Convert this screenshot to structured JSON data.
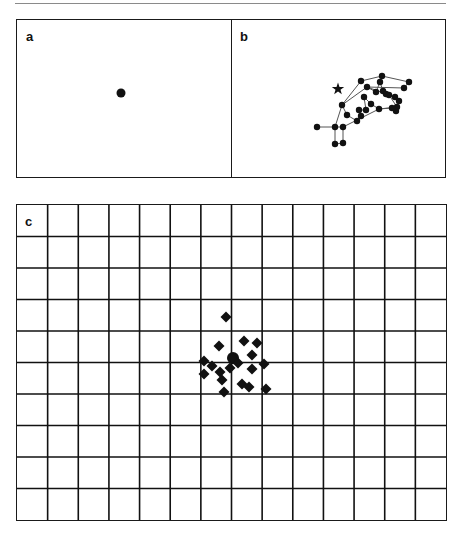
{
  "figure": {
    "panels": [
      {
        "id": "a",
        "label": "a"
      },
      {
        "id": "b",
        "label": "b"
      },
      {
        "id": "c",
        "label": "c"
      }
    ]
  },
  "chart_data": [
    {
      "panel": "a",
      "type": "scatter",
      "title": "",
      "xlabel": "",
      "ylabel": "",
      "grid": false,
      "description": "Single fixation target dot in an empty field",
      "points": [
        {
          "x": 121,
          "y": 93,
          "marker": "circle"
        }
      ]
    },
    {
      "panel": "b",
      "type": "line",
      "title": "",
      "xlabel": "",
      "ylabel": "",
      "grid": false,
      "description": "Fixation trace: connected dots clustered up-right of the target star",
      "target": {
        "x": 338,
        "y": 89,
        "marker": "star"
      },
      "points": [
        {
          "x": 317,
          "y": 127
        },
        {
          "x": 335,
          "y": 127
        },
        {
          "x": 343,
          "y": 127
        },
        {
          "x": 335,
          "y": 144
        },
        {
          "x": 343,
          "y": 143
        },
        {
          "x": 347,
          "y": 115
        },
        {
          "x": 342,
          "y": 105
        },
        {
          "x": 361,
          "y": 81
        },
        {
          "x": 382,
          "y": 76
        },
        {
          "x": 380,
          "y": 82
        },
        {
          "x": 409,
          "y": 82
        },
        {
          "x": 404,
          "y": 88
        },
        {
          "x": 367,
          "y": 87
        },
        {
          "x": 376,
          "y": 92
        },
        {
          "x": 383,
          "y": 91
        },
        {
          "x": 386,
          "y": 94
        },
        {
          "x": 389,
          "y": 95
        },
        {
          "x": 395,
          "y": 97
        },
        {
          "x": 399,
          "y": 101
        },
        {
          "x": 397,
          "y": 107
        },
        {
          "x": 396,
          "y": 111
        },
        {
          "x": 392,
          "y": 108
        },
        {
          "x": 379,
          "y": 109
        },
        {
          "x": 371,
          "y": 104
        },
        {
          "x": 364,
          "y": 97
        },
        {
          "x": 366,
          "y": 110
        },
        {
          "x": 359,
          "y": 110
        },
        {
          "x": 361,
          "y": 116
        },
        {
          "x": 357,
          "y": 121
        }
      ],
      "path_order": [
        0,
        1,
        2,
        4,
        3,
        1,
        6,
        7,
        8,
        10,
        11,
        12,
        13,
        9,
        14,
        15,
        16,
        17,
        18,
        19,
        20,
        21,
        22,
        23,
        24,
        25,
        26,
        27,
        28,
        5,
        6,
        12,
        16,
        19,
        22,
        2
      ]
    },
    {
      "panel": "c",
      "type": "scatter",
      "title": "",
      "xlabel": "",
      "ylabel": "",
      "grid": true,
      "grid_columns": 14,
      "grid_rows": 10,
      "description": "Fixation positions (diamonds) clustered around the center of a 14x10 grid",
      "points": [
        {
          "x": 226,
          "y": 317
        },
        {
          "x": 219,
          "y": 346
        },
        {
          "x": 244,
          "y": 341
        },
        {
          "x": 257,
          "y": 343
        },
        {
          "x": 252,
          "y": 355
        },
        {
          "x": 204,
          "y": 361
        },
        {
          "x": 212,
          "y": 366
        },
        {
          "x": 220,
          "y": 372
        },
        {
          "x": 233,
          "y": 359
        },
        {
          "x": 238,
          "y": 363
        },
        {
          "x": 264,
          "y": 364
        },
        {
          "x": 252,
          "y": 369
        },
        {
          "x": 204,
          "y": 374
        },
        {
          "x": 222,
          "y": 380
        },
        {
          "x": 242,
          "y": 384
        },
        {
          "x": 249,
          "y": 387
        },
        {
          "x": 266,
          "y": 389
        },
        {
          "x": 224,
          "y": 392
        },
        {
          "x": 230,
          "y": 368
        }
      ],
      "center_marker": {
        "x": 233,
        "y": 358,
        "marker": "circle"
      }
    }
  ]
}
